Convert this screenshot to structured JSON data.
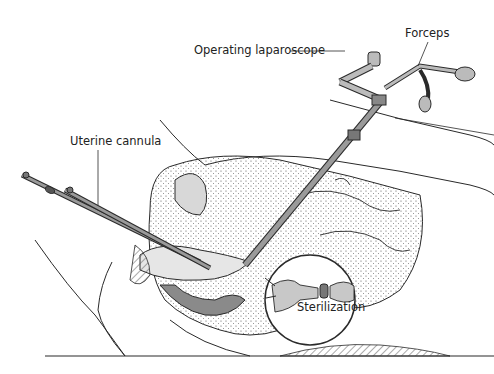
{
  "diagram": {
    "labels": {
      "operating_laparoscope": "Operating laparoscope",
      "forceps": "Forceps",
      "uterine_cannula": "Uterine cannula",
      "sterilization": "Sterilization"
    },
    "colors": {
      "line": "#2a2a2a",
      "instrument_fill": "#9a9a9a",
      "tissue_fill": "#d8d8d8",
      "dark_fill": "#6e6e6e",
      "background": "#ffffff"
    }
  }
}
